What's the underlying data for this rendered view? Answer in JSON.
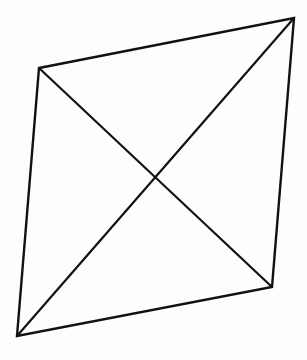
{
  "diagram": {
    "shape": "quadrilateral",
    "stroke_color": "#111111",
    "background_color": "#fdfdfd",
    "vertices": {
      "top_left": [
        39,
        68
      ],
      "top_right": [
        294,
        18
      ],
      "bottom_right": [
        272,
        287
      ],
      "bottom_left": [
        17,
        336
      ]
    },
    "diagonals": [
      {
        "from": "top_left",
        "to": "bottom_right"
      },
      {
        "from": "top_right",
        "to": "bottom_left"
      }
    ],
    "diagonal_intersection": [
      155,
      176
    ]
  }
}
